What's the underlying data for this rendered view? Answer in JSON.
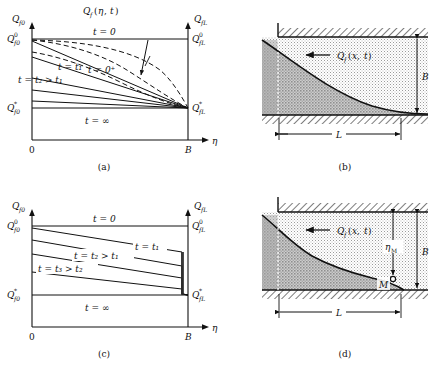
{
  "figure": {
    "panels": [
      {
        "id": "a",
        "caption": "(a)",
        "title": "Q_f(η, t)",
        "title_parts": {
          "q": "Q",
          "fsub": "f",
          "open": "(",
          "eta": "η",
          "comma": ", ",
          "t": "t",
          "close": ")"
        },
        "axis": {
          "y_left_label": "Q",
          "y_left_sub": "f0",
          "y_right_label": "Q",
          "y_right_sub": "fL",
          "x_label": "η",
          "x_tick_origin": "0",
          "x_tick_end": "B"
        },
        "value_labels": [
          {
            "name": "q-f0-zero",
            "base": "Q",
            "sub": "f0",
            "sup": "0"
          },
          {
            "name": "q-f0-star",
            "base": "Q",
            "sub": "f0",
            "sup": "*"
          },
          {
            "name": "q-fl-zero",
            "base": "Q",
            "sub": "fL",
            "sup": "0"
          },
          {
            "name": "q-fl-star",
            "base": "Q",
            "sub": "fL",
            "sup": "*"
          }
        ],
        "curve_labels": [
          {
            "name": "t-zero",
            "text": "t = 0"
          },
          {
            "name": "t-zero-plus",
            "text": "t = 0⁺"
          },
          {
            "name": "t-one",
            "text": "t = t₁"
          },
          {
            "name": "t-two",
            "text": "t = t₂ > t₁"
          },
          {
            "name": "t-infinity",
            "text": "t = ∞"
          }
        ]
      },
      {
        "id": "b",
        "caption": "(b)",
        "flow_label": "Q_f(x, t)",
        "flow_parts": {
          "q": "Q",
          "fsub": "f",
          "open": "(",
          "x": "x",
          "comma": ", ",
          "t": "t",
          "close": ")"
        },
        "dim_height": "B",
        "dim_length": "L"
      },
      {
        "id": "c",
        "caption": "(c)",
        "axis": {
          "y_left_label": "Q",
          "y_left_sub": "f0",
          "y_right_label": "Q",
          "y_right_sub": "fL",
          "x_label": "η",
          "x_tick_origin": "0",
          "x_tick_end": "B"
        },
        "value_labels": [
          {
            "name": "q-f0-zero",
            "base": "Q",
            "sub": "f0",
            "sup": "0"
          },
          {
            "name": "q-f0-star",
            "base": "Q",
            "sub": "f0",
            "sup": "*"
          },
          {
            "name": "q-fl-zero",
            "base": "Q",
            "sub": "fL",
            "sup": "0"
          },
          {
            "name": "q-fl-star",
            "base": "Q",
            "sub": "fL",
            "sup": "*"
          }
        ],
        "curve_labels": [
          {
            "name": "t-zero",
            "text": "t = 0"
          },
          {
            "name": "t-one",
            "text": "t = t₁"
          },
          {
            "name": "t-two",
            "text": "t = t₂ > t₁"
          },
          {
            "name": "t-three",
            "text": "t = t₃ > t₂"
          },
          {
            "name": "t-infinity",
            "text": "t = ∞"
          }
        ]
      },
      {
        "id": "d",
        "caption": "(d)",
        "flow_label": "Q_f(x, t)",
        "flow_parts": {
          "q": "Q",
          "fsub": "f",
          "open": "(",
          "x": "x",
          "comma": ", ",
          "t": "t",
          "close": ")"
        },
        "dim_height": "B",
        "dim_length": "L",
        "dim_eta_m": "η",
        "dim_eta_m_sub": "M",
        "point_label": "M"
      }
    ],
    "colors": {
      "line": "#111111",
      "fill_light": "#d8d8d8",
      "fill_dark": "#9a9a9a",
      "hatch": "#222222",
      "background": "#ffffff"
    }
  }
}
